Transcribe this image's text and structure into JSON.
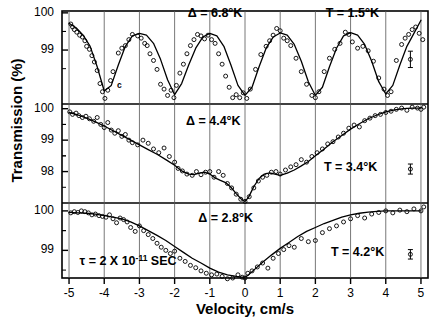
{
  "axes": {
    "ylabel": "Transmission (%)",
    "xlabel": "Velocity, cm/s",
    "xticklabels": [
      "-5",
      "-4",
      "-3",
      "-2",
      "-1",
      "0",
      "1",
      "2",
      "3",
      "4",
      "5"
    ],
    "panel_top_yticklabels": [
      "100",
      "99"
    ],
    "panel_mid_yticklabels": [
      "100",
      "99",
      "98"
    ],
    "panel_bot_yticklabels": [
      "100",
      "99"
    ]
  },
  "annotations": {
    "top_delta": "Δ = 6.8°K",
    "top_temp": "T = 1.5°K",
    "mid_delta": "Δ = 4.4°K",
    "mid_temp": "T = 3.4°K",
    "bot_delta": "Δ = 2.8°K",
    "bot_temp": "T = 4.2°K",
    "tau_prefix": "τ = 2 X 10",
    "tau_exponent": "-11",
    "tau_suffix": "SEC",
    "stray_marker": "c"
  },
  "colors": {
    "ink": "#000000",
    "background": "#ffffff",
    "grid": "#555555"
  },
  "chart_data": {
    "type": "line",
    "title": "",
    "xlabel": "Velocity, cm/s",
    "ylabel": "Transmission (%)",
    "xlim": [
      -5.2,
      5.2
    ],
    "grid": true,
    "legend": false,
    "panels": [
      {
        "name": "top",
        "temperature_K": 1.5,
        "delta_K": 6.8,
        "ylim": [
          97.55,
          100.05
        ],
        "yticks": [
          100,
          99
        ],
        "error_bar": {
          "x": 4.7,
          "y": 98.75,
          "half_height": 0.22
        },
        "fit_x": [
          -5.0,
          -4.8,
          -4.6,
          -4.4,
          -4.2,
          -4.0,
          -3.8,
          -3.6,
          -3.4,
          -3.2,
          -3.0,
          -2.8,
          -2.6,
          -2.4,
          -2.2,
          -2.0,
          -1.8,
          -1.6,
          -1.4,
          -1.2,
          -1.0,
          -0.8,
          -0.6,
          -0.4,
          -0.2,
          0.0,
          0.2,
          0.4,
          0.6,
          0.8,
          1.0,
          1.2,
          1.4,
          1.6,
          1.8,
          2.0,
          2.2,
          2.4,
          2.6,
          2.8,
          3.0,
          3.2,
          3.4,
          3.6,
          3.8,
          4.0,
          4.2,
          4.4,
          4.6,
          4.8,
          5.0
        ],
        "fit_y": [
          99.72,
          99.6,
          99.4,
          99.1,
          98.55,
          97.9,
          98.05,
          98.6,
          99.1,
          99.38,
          99.45,
          99.4,
          99.18,
          98.75,
          98.2,
          97.8,
          98.1,
          98.6,
          99.05,
          99.35,
          99.45,
          99.38,
          99.1,
          98.6,
          98.05,
          97.78,
          98.0,
          98.55,
          99.05,
          99.35,
          99.46,
          99.4,
          99.15,
          98.7,
          98.15,
          97.78,
          98.0,
          98.55,
          99.05,
          99.38,
          99.47,
          99.4,
          99.15,
          98.7,
          98.15,
          97.82,
          98.05,
          98.6,
          99.1,
          99.45,
          99.8
        ],
        "points_x": [
          -4.95,
          -4.9,
          -4.85,
          -4.78,
          -4.7,
          -4.62,
          -4.55,
          -4.5,
          -4.42,
          -4.35,
          -4.28,
          -4.2,
          -4.12,
          -4.05,
          -3.98,
          -3.9,
          -3.82,
          -3.75,
          -3.6,
          -3.5,
          -3.4,
          -3.3,
          -3.2,
          -3.05,
          -2.95,
          -2.85,
          -2.78,
          -2.7,
          -2.6,
          -2.5,
          -2.4,
          -2.3,
          -2.2,
          -2.1,
          -2.02,
          -1.95,
          -1.85,
          -1.75,
          -1.65,
          -1.55,
          -1.45,
          -1.35,
          -1.25,
          -1.15,
          -1.05,
          -0.95,
          -0.85,
          -0.75,
          -0.65,
          -0.55,
          -0.45,
          -0.35,
          -0.25,
          -0.15,
          -0.05,
          0.05,
          0.15,
          0.3,
          0.45,
          0.6,
          0.7,
          0.8,
          0.9,
          1.0,
          1.1,
          1.2,
          1.3,
          1.45,
          1.6,
          1.75,
          1.9,
          2.0,
          2.1,
          2.25,
          2.4,
          2.55,
          2.7,
          2.85,
          2.95,
          3.05,
          3.2,
          3.35,
          3.5,
          3.65,
          3.8,
          3.95,
          4.05,
          4.15,
          4.3,
          4.45,
          4.55,
          4.65,
          4.75,
          4.85,
          4.95,
          5.05
        ],
        "points_y": [
          99.7,
          99.62,
          99.55,
          99.48,
          99.4,
          99.35,
          99.25,
          99.1,
          99.02,
          98.85,
          98.68,
          98.45,
          98.1,
          97.88,
          97.7,
          97.92,
          98.18,
          98.42,
          98.92,
          99.05,
          99.12,
          99.28,
          99.42,
          99.38,
          99.32,
          99.18,
          99.12,
          98.9,
          98.72,
          98.48,
          98.08,
          97.95,
          97.78,
          97.92,
          97.72,
          98.05,
          98.38,
          98.62,
          98.9,
          99.12,
          99.28,
          99.42,
          99.38,
          99.3,
          99.4,
          99.28,
          99.18,
          98.9,
          98.62,
          98.3,
          98.0,
          97.72,
          97.8,
          97.72,
          97.85,
          97.7,
          97.95,
          98.48,
          98.88,
          99.1,
          99.25,
          99.4,
          99.58,
          99.52,
          99.32,
          99.25,
          99.12,
          98.78,
          98.42,
          98.08,
          97.78,
          97.72,
          97.88,
          98.42,
          98.78,
          99.02,
          99.18,
          99.48,
          99.42,
          99.22,
          99.05,
          99.1,
          98.98,
          98.7,
          98.25,
          97.95,
          97.78,
          97.88,
          98.72,
          99.15,
          99.32,
          99.42,
          99.55,
          99.62,
          99.45,
          99.28
        ],
        "stray_point": {
          "x": -3.72,
          "y": 98.05
        }
      },
      {
        "name": "middle",
        "temperature_K": 3.4,
        "delta_K": 4.4,
        "ylim": [
          97.0,
          100.15
        ],
        "yticks": [
          100,
          99,
          98
        ],
        "error_bar": {
          "x": 4.7,
          "y": 98.08,
          "half_height": 0.16
        },
        "fit_x": [
          -5.0,
          -4.75,
          -4.5,
          -4.25,
          -4.0,
          -3.75,
          -3.5,
          -3.25,
          -3.0,
          -2.75,
          -2.5,
          -2.25,
          -2.0,
          -1.8,
          -1.6,
          -1.45,
          -1.3,
          -1.15,
          -1.0,
          -0.85,
          -0.7,
          -0.55,
          -0.4,
          -0.25,
          -0.1,
          0.0,
          0.1,
          0.25,
          0.4,
          0.55,
          0.7,
          0.85,
          1.0,
          1.2,
          1.4,
          1.6,
          1.8,
          2.0,
          2.25,
          2.5,
          2.75,
          3.0,
          3.25,
          3.5,
          3.75,
          4.0,
          4.25,
          4.5,
          4.75,
          5.0
        ],
        "fit_y": [
          99.88,
          99.8,
          99.7,
          99.58,
          99.45,
          99.3,
          99.15,
          99.0,
          98.85,
          98.7,
          98.55,
          98.38,
          98.2,
          98.02,
          97.92,
          97.9,
          97.95,
          97.98,
          97.92,
          97.8,
          97.72,
          97.65,
          97.5,
          97.3,
          97.12,
          97.05,
          97.18,
          97.52,
          97.78,
          97.92,
          97.96,
          97.92,
          97.88,
          97.95,
          98.05,
          98.18,
          98.32,
          98.5,
          98.72,
          98.95,
          99.15,
          99.35,
          99.52,
          99.68,
          99.8,
          99.9,
          99.96,
          100.0,
          100.02,
          100.02
        ],
        "points_x": [
          -4.98,
          -4.9,
          -4.8,
          -4.72,
          -4.62,
          -4.52,
          -4.42,
          -4.3,
          -4.2,
          -4.1,
          -4.0,
          -3.9,
          -3.8,
          -3.7,
          -3.6,
          -3.5,
          -3.4,
          -3.3,
          -3.2,
          -3.05,
          -2.9,
          -2.75,
          -2.6,
          -2.45,
          -2.3,
          -2.15,
          -2.0,
          -1.9,
          -1.78,
          -1.65,
          -1.5,
          -1.38,
          -1.25,
          -1.12,
          -1.0,
          -0.88,
          -0.75,
          -0.62,
          -0.5,
          -0.38,
          -0.25,
          -0.12,
          0.0,
          0.12,
          0.25,
          0.38,
          0.5,
          0.62,
          0.75,
          0.88,
          1.0,
          1.15,
          1.3,
          1.45,
          1.6,
          1.75,
          1.9,
          2.05,
          2.2,
          2.35,
          2.5,
          2.65,
          2.8,
          2.95,
          3.1,
          3.25,
          3.4,
          3.55,
          3.7,
          3.85,
          4.0,
          4.15,
          4.3,
          4.45,
          4.6,
          4.75,
          4.9,
          5.0,
          5.08
        ],
        "points_y": [
          99.9,
          99.82,
          99.86,
          99.78,
          99.72,
          99.76,
          99.68,
          99.6,
          99.72,
          99.5,
          99.4,
          99.56,
          99.32,
          99.22,
          99.3,
          99.12,
          99.18,
          99.0,
          98.92,
          98.85,
          99.0,
          98.9,
          98.72,
          98.6,
          98.75,
          98.48,
          98.3,
          98.1,
          98.02,
          97.92,
          97.88,
          98.0,
          97.9,
          97.98,
          98.0,
          97.82,
          98.0,
          97.88,
          97.62,
          97.48,
          97.28,
          97.12,
          97.05,
          97.2,
          97.48,
          97.7,
          97.82,
          97.88,
          97.98,
          98.0,
          97.92,
          98.05,
          98.15,
          98.22,
          98.38,
          98.3,
          98.48,
          98.6,
          98.72,
          98.88,
          98.95,
          99.1,
          99.22,
          99.38,
          99.48,
          99.42,
          99.62,
          99.7,
          99.78,
          99.82,
          99.88,
          99.92,
          99.98,
          100.02,
          99.95,
          100.05,
          100.02,
          99.98,
          100.05
        ]
      },
      {
        "name": "bottom",
        "temperature_K": 4.2,
        "delta_K": 2.8,
        "ylim": [
          98.3,
          100.2
        ],
        "yticks": [
          100,
          99
        ],
        "error_bar": {
          "x": 4.7,
          "y": 98.9,
          "half_height": 0.12
        },
        "fit_x": [
          -5.0,
          -4.75,
          -4.5,
          -4.25,
          -4.0,
          -3.75,
          -3.5,
          -3.25,
          -3.0,
          -2.75,
          -2.5,
          -2.25,
          -2.0,
          -1.75,
          -1.5,
          -1.25,
          -1.0,
          -0.75,
          -0.5,
          -0.25,
          -0.1,
          0.0,
          0.1,
          0.25,
          0.5,
          0.75,
          1.0,
          1.25,
          1.5,
          1.75,
          2.0,
          2.25,
          2.5,
          2.75,
          3.0,
          3.25,
          3.5,
          3.75,
          4.0,
          4.25,
          4.5,
          4.75,
          5.0
        ],
        "fit_y": [
          99.96,
          99.95,
          99.94,
          99.92,
          99.88,
          99.84,
          99.8,
          99.72,
          99.62,
          99.5,
          99.38,
          99.25,
          99.1,
          98.95,
          98.8,
          98.68,
          98.55,
          98.45,
          98.38,
          98.34,
          98.32,
          98.32,
          98.38,
          98.5,
          98.7,
          98.88,
          99.05,
          99.2,
          99.35,
          99.48,
          99.58,
          99.68,
          99.76,
          99.84,
          99.9,
          99.94,
          99.97,
          99.99,
          100.0,
          100.0,
          100.0,
          100.0,
          100.0
        ],
        "points_x": [
          -4.95,
          -4.85,
          -4.75,
          -4.65,
          -4.55,
          -4.45,
          -4.35,
          -4.25,
          -4.15,
          -4.05,
          -3.95,
          -3.85,
          -3.75,
          -3.65,
          -3.55,
          -3.45,
          -3.35,
          -3.25,
          -3.12,
          -3.0,
          -2.88,
          -2.75,
          -2.62,
          -2.5,
          -2.38,
          -2.25,
          -2.12,
          -2.0,
          -1.85,
          -1.7,
          -1.55,
          -1.4,
          -1.25,
          -1.1,
          -0.95,
          -0.8,
          -0.65,
          -0.5,
          -0.35,
          -0.2,
          -0.08,
          0.0,
          0.08,
          0.2,
          0.35,
          0.5,
          0.65,
          0.8,
          0.95,
          1.1,
          1.25,
          1.4,
          1.6,
          1.8,
          2.0,
          2.2,
          2.4,
          2.6,
          2.8,
          3.0,
          3.2,
          3.4,
          3.6,
          3.8,
          4.0,
          4.2,
          4.4,
          4.6,
          4.8,
          5.0,
          5.08
        ],
        "points_y": [
          99.95,
          99.98,
          99.96,
          100.0,
          99.98,
          99.95,
          99.9,
          99.92,
          99.88,
          99.86,
          99.84,
          99.9,
          99.8,
          99.7,
          99.82,
          99.78,
          99.72,
          99.58,
          99.48,
          99.62,
          99.5,
          99.4,
          99.3,
          99.18,
          99.08,
          99.0,
          98.92,
          98.98,
          98.8,
          98.72,
          98.62,
          98.56,
          98.48,
          98.42,
          98.38,
          98.4,
          98.34,
          98.28,
          98.3,
          98.38,
          98.32,
          98.3,
          98.42,
          98.48,
          98.58,
          98.68,
          98.55,
          98.8,
          98.92,
          99.02,
          99.12,
          99.08,
          99.3,
          99.22,
          99.25,
          99.45,
          99.55,
          99.62,
          99.72,
          99.8,
          99.88,
          99.82,
          99.92,
          99.96,
          100.0,
          99.95,
          100.02,
          99.98,
          100.05,
          100.0,
          100.1
        ]
      }
    ]
  }
}
